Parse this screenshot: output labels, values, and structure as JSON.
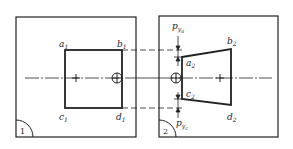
{
  "figure": {
    "type": "technical-diagram",
    "panels": [
      {
        "id": "1",
        "number_label": "1",
        "shape": "square",
        "corners": [
          {
            "name": "a",
            "sub": "1"
          },
          {
            "name": "b",
            "sub": "1"
          },
          {
            "name": "c",
            "sub": "1"
          },
          {
            "name": "d",
            "sub": "1"
          }
        ]
      },
      {
        "id": "2",
        "number_label": "2",
        "shape": "trapezoid",
        "corners": [
          {
            "name": "a",
            "sub": "2"
          },
          {
            "name": "b",
            "sub": "2"
          },
          {
            "name": "c",
            "sub": "2"
          },
          {
            "name": "d",
            "sub": "2"
          }
        ],
        "dimensions": [
          {
            "name": "p",
            "sub": "y",
            "subsub": "a"
          },
          {
            "name": "p",
            "sub": "y",
            "subsub": "c"
          }
        ]
      }
    ],
    "colors": {
      "line": "#222222",
      "background": "#ffffff"
    }
  }
}
